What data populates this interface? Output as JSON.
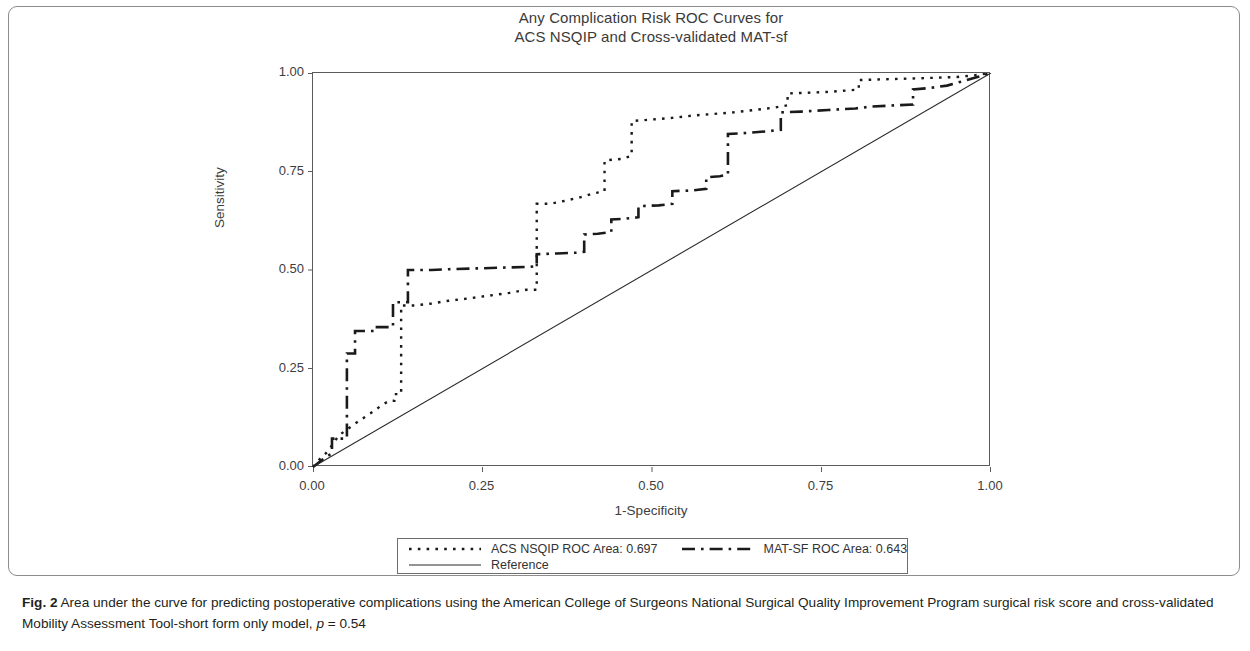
{
  "figure": {
    "label": "Fig. 2",
    "caption_text": " Area under the curve for predicting postoperative complications using the American College of Surgeons National Surgical Quality Improvement Program surgical risk score and cross-validated Mobility Assessment Tool-short form only model, ",
    "caption_p_symbol": "p",
    "caption_p_value": " = 0.54"
  },
  "chart_data": {
    "type": "line",
    "title": "Any Complication Risk ROC Curves for",
    "subtitle": "ACS NSQIP and Cross-validated MAT-sf",
    "xlabel": "1-Specificity",
    "ylabel": "Sensitivity",
    "xlim": [
      0,
      1
    ],
    "ylim": [
      0,
      1
    ],
    "grid": false,
    "legend_position": "below-plot",
    "xticks": [
      "0.00",
      "0.25",
      "0.50",
      "0.75",
      "1.00"
    ],
    "xtick_values": [
      0.0,
      0.25,
      0.5,
      0.75,
      1.0
    ],
    "yticks": [
      "0.00",
      "0.25",
      "0.50",
      "0.75",
      "1.00"
    ],
    "ytick_values": [
      0.0,
      0.25,
      0.5,
      0.75,
      1.0
    ],
    "series": [
      {
        "name": "ACS NSQIP ROC Area: 0.697",
        "legend_label": "ACS NSQIP ROC Area: 0.697",
        "auc": 0.697,
        "style": "dotted",
        "color": "#1a1a1a",
        "points": [
          [
            0.0,
            0.0
          ],
          [
            0.01,
            0.02
          ],
          [
            0.022,
            0.04
          ],
          [
            0.03,
            0.06
          ],
          [
            0.038,
            0.08
          ],
          [
            0.05,
            0.095
          ],
          [
            0.062,
            0.11
          ],
          [
            0.075,
            0.125
          ],
          [
            0.088,
            0.14
          ],
          [
            0.1,
            0.155
          ],
          [
            0.112,
            0.168
          ],
          [
            0.12,
            0.168
          ],
          [
            0.12,
            0.185
          ],
          [
            0.13,
            0.185
          ],
          [
            0.13,
            0.41
          ],
          [
            0.15,
            0.41
          ],
          [
            0.175,
            0.415
          ],
          [
            0.2,
            0.422
          ],
          [
            0.23,
            0.428
          ],
          [
            0.26,
            0.435
          ],
          [
            0.29,
            0.442
          ],
          [
            0.315,
            0.45
          ],
          [
            0.33,
            0.45
          ],
          [
            0.33,
            0.668
          ],
          [
            0.35,
            0.668
          ],
          [
            0.37,
            0.675
          ],
          [
            0.395,
            0.685
          ],
          [
            0.415,
            0.695
          ],
          [
            0.43,
            0.7
          ],
          [
            0.43,
            0.778
          ],
          [
            0.455,
            0.782
          ],
          [
            0.47,
            0.79
          ],
          [
            0.47,
            0.878
          ],
          [
            0.5,
            0.882
          ],
          [
            0.53,
            0.886
          ],
          [
            0.56,
            0.892
          ],
          [
            0.59,
            0.896
          ],
          [
            0.62,
            0.9
          ],
          [
            0.65,
            0.906
          ],
          [
            0.68,
            0.912
          ],
          [
            0.7,
            0.918
          ],
          [
            0.7,
            0.948
          ],
          [
            0.73,
            0.95
          ],
          [
            0.76,
            0.952
          ],
          [
            0.79,
            0.956
          ],
          [
            0.805,
            0.958
          ],
          [
            0.805,
            0.982
          ],
          [
            0.84,
            0.984
          ],
          [
            0.88,
            0.986
          ],
          [
            0.92,
            0.988
          ],
          [
            0.95,
            0.99
          ],
          [
            0.975,
            0.994
          ],
          [
            1.0,
            1.0
          ]
        ]
      },
      {
        "name": "MAT-SF ROC Area: 0.643",
        "legend_label": "MAT-SF ROC Area: 0.643",
        "auc": 0.643,
        "style": "dashed",
        "color": "#1a1a1a",
        "points": [
          [
            0.0,
            0.0
          ],
          [
            0.015,
            0.02
          ],
          [
            0.028,
            0.035
          ],
          [
            0.028,
            0.072
          ],
          [
            0.05,
            0.072
          ],
          [
            0.05,
            0.288
          ],
          [
            0.062,
            0.288
          ],
          [
            0.062,
            0.345
          ],
          [
            0.09,
            0.345
          ],
          [
            0.09,
            0.355
          ],
          [
            0.118,
            0.355
          ],
          [
            0.118,
            0.418
          ],
          [
            0.14,
            0.418
          ],
          [
            0.14,
            0.5
          ],
          [
            0.175,
            0.5
          ],
          [
            0.2,
            0.502
          ],
          [
            0.24,
            0.504
          ],
          [
            0.28,
            0.506
          ],
          [
            0.32,
            0.508
          ],
          [
            0.33,
            0.51
          ],
          [
            0.33,
            0.54
          ],
          [
            0.36,
            0.542
          ],
          [
            0.39,
            0.544
          ],
          [
            0.4,
            0.546
          ],
          [
            0.4,
            0.59
          ],
          [
            0.42,
            0.592
          ],
          [
            0.44,
            0.596
          ],
          [
            0.44,
            0.628
          ],
          [
            0.46,
            0.63
          ],
          [
            0.48,
            0.634
          ],
          [
            0.48,
            0.662
          ],
          [
            0.51,
            0.664
          ],
          [
            0.53,
            0.668
          ],
          [
            0.53,
            0.7
          ],
          [
            0.56,
            0.702
          ],
          [
            0.58,
            0.706
          ],
          [
            0.58,
            0.735
          ],
          [
            0.6,
            0.738
          ],
          [
            0.612,
            0.742
          ],
          [
            0.612,
            0.845
          ],
          [
            0.64,
            0.848
          ],
          [
            0.67,
            0.852
          ],
          [
            0.69,
            0.856
          ],
          [
            0.69,
            0.9
          ],
          [
            0.72,
            0.902
          ],
          [
            0.76,
            0.906
          ],
          [
            0.8,
            0.91
          ],
          [
            0.825,
            0.915
          ],
          [
            0.86,
            0.918
          ],
          [
            0.885,
            0.92
          ],
          [
            0.885,
            0.958
          ],
          [
            0.91,
            0.962
          ],
          [
            0.935,
            0.968
          ],
          [
            0.96,
            0.98
          ],
          [
            0.98,
            0.99
          ],
          [
            1.0,
            1.0
          ]
        ]
      },
      {
        "name": "Reference",
        "legend_label": "Reference",
        "style": "solid",
        "color": "#2b2b2b",
        "points": [
          [
            0.0,
            0.0
          ],
          [
            1.0,
            1.0
          ]
        ]
      }
    ]
  }
}
